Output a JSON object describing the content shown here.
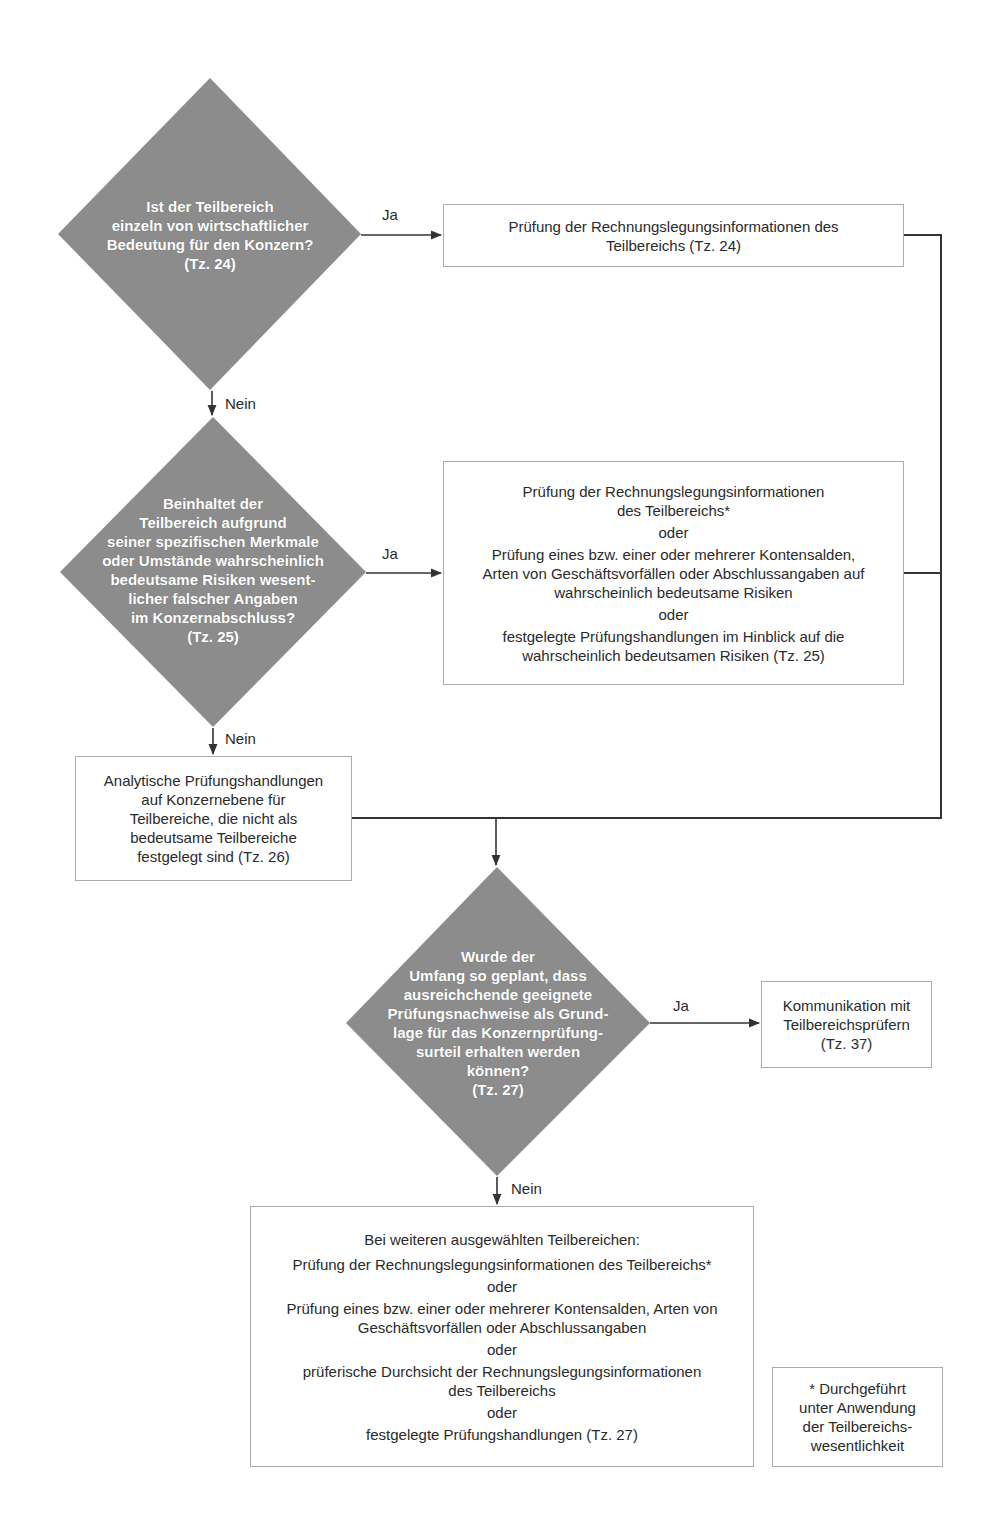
{
  "colors": {
    "decision_fill": "#8c8c8c",
    "decision_text": "#ffffff",
    "box_border": "#aaaaaa",
    "connector": "#333333"
  },
  "decisions": [
    {
      "id": "d1",
      "text": "Ist der Teilbereich\neinzeln von  wirtschaftlicher\nBedeutung für den Konzern?\n(Tz. 24)"
    },
    {
      "id": "d2",
      "text": "Beinhaltet der\nTeilbereich aufgrund\nseiner spezifischen Merkmale\noder Umstände wahrscheinlich\nbedeutsame Risiken wesent-\nlicher falscher Angaben\nim Konzernabschluss?\n(Tz. 25)"
    },
    {
      "id": "d3",
      "text": "Wurde der\nUmfang so geplant, dass\nausreichchende geeignete\nPrüfungsnachweise als Grund-\nlage für das Konzernprüfung-\nsurteil erhalten werden\nkönnen?\n(Tz. 27)"
    }
  ],
  "boxes": {
    "b1": {
      "parts": [
        "Prüfung der Rechnungslegungsinformationen des\nTeilbereichs (Tz. 24)"
      ]
    },
    "b2": {
      "parts": [
        "Prüfung der Rechnungslegungsinformationen\ndes Teilbereichs*",
        "oder",
        "Prüfung eines bzw. einer oder  mehrerer Kontensalden,\nArten von Geschäftsvorfällen oder Abschlussangaben auf\nwahrscheinlich bedeutsame Risiken",
        "oder",
        "festgelegte Prüfungshandlungen im Hinblick auf die\nwahrscheinlich bedeutsamen Risiken (Tz. 25)"
      ]
    },
    "b3": {
      "parts": [
        "Analytische Prüfungshandlungen\nauf Konzernebene für\nTeilbereiche, die nicht als\nbedeutsame Teilbereiche\nfestgelegt sind (Tz. 26)"
      ]
    },
    "b4": {
      "parts": [
        "Kommunikation mit\nTeilbereichsprüfern\n(Tz. 37)"
      ]
    },
    "b5": {
      "parts": [
        "Bei weiteren ausgewählten Teilbereichen:",
        "Prüfung der Rechnungslegungsinformationen des Teilbereichs*",
        "oder",
        "Prüfung eines bzw. einer oder mehrerer Kontensalden, Arten von\nGeschäftsvorfällen oder Abschlussangaben",
        "oder",
        "prüferische Durchsicht der Rechnungslegungsinformationen\ndes Teilbereichs",
        "oder",
        "festgelegte Prüfungshandlungen (Tz. 27)"
      ]
    },
    "footnote": {
      "parts": [
        "* Durchgeführt\nunter Anwendung\nder Teilbereichs-\nwesentlichkeit"
      ]
    }
  },
  "edge_labels": {
    "d1_yes": "Ja",
    "d1_no": "Nein",
    "d2_yes": "Ja",
    "d2_no": "Nein",
    "d3_yes": "Ja",
    "d3_no": "Nein"
  }
}
